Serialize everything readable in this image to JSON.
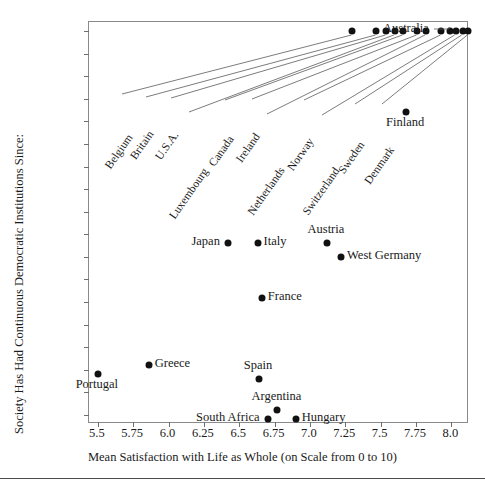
{
  "chart_data": {
    "type": "scatter",
    "title": "",
    "xlabel": "Mean Satisfaction with Life as Whole (on Scale from 0 to 10)",
    "ylabel": "Society Has Had Continuous Democratic Institutions Since:",
    "xlim": [
      5.4375,
      8.125
    ],
    "ylim": [
      1898,
      1987
    ],
    "grid": false,
    "legend": null,
    "xticks": [
      "5.5",
      "5.75",
      "6.0",
      "6.25",
      "6.5",
      "6.75",
      "7.0",
      "7.25",
      "7.5",
      "7.75",
      "8.0"
    ],
    "xtickvalues": [
      5.5,
      5.75,
      6.0,
      6.25,
      6.5,
      6.75,
      7.0,
      7.25,
      7.5,
      7.75,
      8.0
    ],
    "yticks": [
      "Before 1900",
      "1905",
      "1910",
      "1915",
      "1920",
      "1925",
      "1930",
      "1935",
      "1940",
      "1945",
      "1950",
      "1955",
      "1960",
      "1965",
      "1970",
      "1975",
      "1980",
      "After 1985"
    ],
    "ytickvalues": [
      1900,
      1905,
      1910,
      1915,
      1920,
      1925,
      1930,
      1935,
      1940,
      1945,
      1950,
      1955,
      1960,
      1965,
      1970,
      1975,
      1980,
      1985
    ],
    "points": [
      {
        "name": "Belgium",
        "x": 7.3,
        "y": 1900,
        "label_style": "diagonal"
      },
      {
        "name": "Britain",
        "x": 7.47,
        "y": 1900,
        "label_style": "diagonal"
      },
      {
        "name": "U.S.A.",
        "x": 7.54,
        "y": 1900,
        "label_style": "diagonal"
      },
      {
        "name": "Luxembourg",
        "x": 7.6,
        "y": 1900,
        "label_style": "diagonal"
      },
      {
        "name": "Canada",
        "x": 7.66,
        "y": 1900,
        "label_style": "diagonal"
      },
      {
        "name": "Ireland",
        "x": 7.76,
        "y": 1900,
        "label_style": "diagonal"
      },
      {
        "name": "Netherlands",
        "x": 7.82,
        "y": 1900,
        "label_style": "diagonal"
      },
      {
        "name": "Norway",
        "x": 7.93,
        "y": 1900,
        "label_style": "diagonal"
      },
      {
        "name": "Australia",
        "x": 7.99,
        "y": 1900,
        "label_style": "leader"
      },
      {
        "name": "Switzerland",
        "x": 8.03,
        "y": 1900,
        "label_style": "diagonal"
      },
      {
        "name": "Sweden",
        "x": 8.08,
        "y": 1900,
        "label_style": "diagonal"
      },
      {
        "name": "Denmark",
        "x": 8.12,
        "y": 1900,
        "label_style": "diagonal"
      },
      {
        "name": "Finland",
        "x": 7.68,
        "y": 1918,
        "label_style": "below"
      },
      {
        "name": "Japan",
        "x": 6.42,
        "y": 1947,
        "label_style": "left"
      },
      {
        "name": "Italy",
        "x": 6.63,
        "y": 1947,
        "label_style": "right"
      },
      {
        "name": "Austria",
        "x": 7.12,
        "y": 1947,
        "label_style": "above"
      },
      {
        "name": "West Germany",
        "x": 7.22,
        "y": 1950,
        "label_style": "right"
      },
      {
        "name": "France",
        "x": 6.66,
        "y": 1959,
        "label_style": "right"
      },
      {
        "name": "Portugal",
        "x": 5.5,
        "y": 1976,
        "label_style": "below"
      },
      {
        "name": "Greece",
        "x": 5.86,
        "y": 1974,
        "label_style": "right"
      },
      {
        "name": "Spain",
        "x": 6.64,
        "y": 1977,
        "label_style": "above"
      },
      {
        "name": "Argentina",
        "x": 6.77,
        "y": 1984,
        "label_style": "above"
      },
      {
        "name": "South Africa",
        "x": 6.7,
        "y": 1986,
        "label_style": "left"
      },
      {
        "name": "Hungary",
        "x": 6.9,
        "y": 1986,
        "label_style": "right"
      }
    ]
  }
}
